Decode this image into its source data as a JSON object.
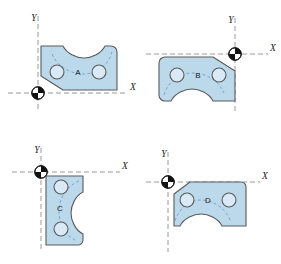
{
  "figure": {
    "background_color": "#ffffff",
    "part_fill_color": "#bcd9ec",
    "part_stroke_color": "#5a5a5a",
    "hole_fill_color": "#d6e8f4",
    "axis_color": "#8c8c8c",
    "hidden_line_color": "#6f9fc4",
    "origin_marker_color": "#111111"
  },
  "quadrants": [
    {
      "id": "quadrant-a",
      "part_label": "A",
      "x_axis_label": "X",
      "y_axis_label": "Y",
      "origin_marker": "datum-origin-marker",
      "origin_position": "lower-left",
      "notch_side": "top"
    },
    {
      "id": "quadrant-b",
      "part_label": "B",
      "x_axis_label": "X",
      "y_axis_label": "Y",
      "origin_marker": "datum-origin-marker",
      "origin_position": "upper-right",
      "notch_side": "bottom"
    },
    {
      "id": "quadrant-c",
      "part_label": "C",
      "x_axis_label": "X",
      "y_axis_label": "Y",
      "origin_marker": "datum-origin-marker",
      "origin_position": "upper-left",
      "notch_side": "right"
    },
    {
      "id": "quadrant-d",
      "part_label": "D",
      "x_axis_label": "X",
      "y_axis_label": "Y",
      "origin_marker": "datum-origin-marker",
      "origin_position": "upper-left",
      "notch_side": "bottom"
    }
  ]
}
